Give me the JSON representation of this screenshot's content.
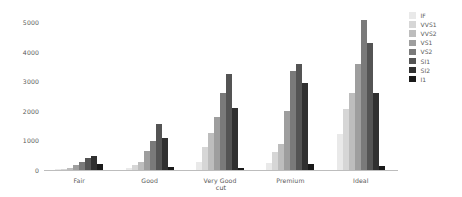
{
  "chart_data": {
    "type": "bar",
    "title": "",
    "subtitle": "",
    "xlabel": "cut",
    "ylabel": "",
    "categories": [
      "Fair",
      "Good",
      "Very Good",
      "Premium",
      "Ideal"
    ],
    "ylim": [
      0,
      5000
    ],
    "yticks": [
      0,
      1000,
      2000,
      3000,
      4000,
      5000
    ],
    "ytick_labels": [
      "0",
      "1000",
      "2000",
      "3000",
      "4000",
      "5000"
    ],
    "grid": false,
    "legend_position": "right",
    "legend_title": "",
    "series": [
      {
        "name": "IF",
        "color": "#e9e9e9",
        "values": [
          9,
          71,
          268,
          230,
          1212
        ]
      },
      {
        "name": "VVS1",
        "color": "#d6d6d6",
        "values": [
          17,
          186,
          789,
          616,
          2047
        ]
      },
      {
        "name": "VVS2",
        "color": "#bdbdbd",
        "values": [
          69,
          286,
          1235,
          870,
          2606
        ]
      },
      {
        "name": "VS1",
        "color": "#9e9e9e",
        "values": [
          170,
          648,
          1775,
          1989,
          3589
        ]
      },
      {
        "name": "VS2",
        "color": "#7a7a7a",
        "values": [
          261,
          978,
          2591,
          3357,
          5071
        ]
      },
      {
        "name": "SI1",
        "color": "#545454",
        "values": [
          408,
          1560,
          3240,
          3575,
          4282
        ]
      },
      {
        "name": "SI2",
        "color": "#303030",
        "values": [
          466,
          1081,
          2100,
          2949,
          2598
        ]
      },
      {
        "name": "I1",
        "color": "#1a1a1a",
        "values": [
          210,
          96,
          84,
          205,
          146
        ]
      }
    ]
  },
  "axis": {
    "x_title": "cut"
  }
}
